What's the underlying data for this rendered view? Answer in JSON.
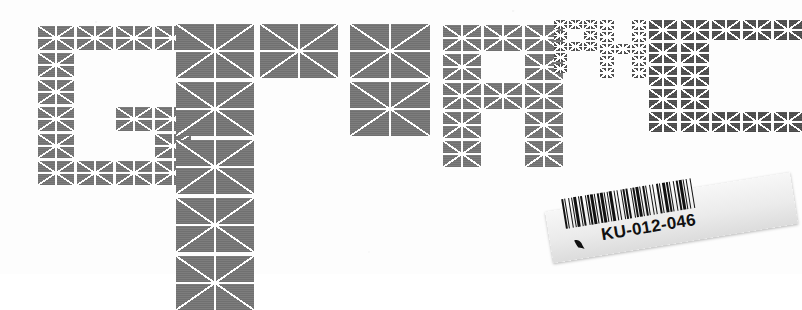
{
  "poster": {
    "word": "GRAPHIC",
    "description": "Typographic poster: the word GRAPHIC built from grey image-placeholder modules (rectangles with an X and a centre cross) at varying scales on a white page",
    "background_color": "#ffffff",
    "module_color": "#767676",
    "module_color_dark": "#4e4e4e",
    "module_line_color": "#ffffff",
    "letters": [
      {
        "char": "G",
        "name": "letter-g",
        "x": 38,
        "y": 26,
        "cell_w": 36,
        "cell_h": 24,
        "gap": 3,
        "tone": "",
        "cols": 4,
        "rows": 6,
        "grid": [
          [
            1,
            1,
            1,
            1
          ],
          [
            1,
            0,
            0,
            0
          ],
          [
            1,
            0,
            0,
            0
          ],
          [
            1,
            0,
            1,
            1
          ],
          [
            1,
            0,
            0,
            1
          ],
          [
            1,
            1,
            1,
            1
          ]
        ]
      },
      {
        "char": "R",
        "name": "letter-r-large",
        "x": 176,
        "y": 24,
        "cell_w": 78,
        "cell_h": 54,
        "gap": 4,
        "tone": "",
        "cols": 1,
        "rows": 5,
        "grid": [
          [
            1
          ],
          [
            1
          ],
          [
            1
          ],
          [
            1
          ],
          [
            1
          ]
        ]
      },
      {
        "char": "A",
        "name": "letter-a-large",
        "x": 260,
        "y": 24,
        "cell_w": 78,
        "cell_h": 54,
        "gap": 4,
        "tone": "",
        "cols": 1,
        "rows": 1,
        "grid": [
          [
            1
          ]
        ]
      },
      {
        "char": "P",
        "name": "letter-p-large",
        "x": 350,
        "y": 24,
        "cell_w": 80,
        "cell_h": 54,
        "gap": 4,
        "tone": "",
        "cols": 1,
        "rows": 2,
        "grid": [
          [
            1
          ],
          [
            1
          ]
        ]
      },
      {
        "char": "R",
        "name": "letter-r-medium",
        "x": 443,
        "y": 25,
        "cell_w": 38,
        "cell_h": 26,
        "gap": 3,
        "tone": "",
        "cols": 3,
        "rows": 5,
        "grid": [
          [
            1,
            1,
            1
          ],
          [
            1,
            0,
            1
          ],
          [
            1,
            1,
            1
          ],
          [
            1,
            0,
            1
          ],
          [
            1,
            0,
            1
          ]
        ]
      },
      {
        "char": "P",
        "name": "letter-p-tiny",
        "x": 554,
        "y": 20,
        "cell_w": 13,
        "cell_h": 9,
        "gap": 2,
        "tone": "dark",
        "cols": 3,
        "rows": 5,
        "grid": [
          [
            1,
            1,
            1
          ],
          [
            1,
            0,
            1
          ],
          [
            1,
            1,
            1
          ],
          [
            1,
            0,
            0
          ],
          [
            1,
            0,
            0
          ]
        ]
      },
      {
        "char": "H",
        "name": "letter-h-tiny",
        "x": 600,
        "y": 20,
        "cell_w": 14,
        "cell_h": 10,
        "gap": 2,
        "tone": "dark",
        "cols": 3,
        "rows": 5,
        "grid": [
          [
            1,
            0,
            1
          ],
          [
            1,
            0,
            1
          ],
          [
            1,
            1,
            1
          ],
          [
            1,
            0,
            1
          ],
          [
            1,
            0,
            1
          ]
        ]
      },
      {
        "char": "I",
        "name": "letter-i-small",
        "x": 649,
        "y": 20,
        "cell_w": 28,
        "cell_h": 20,
        "gap": 3,
        "tone": "dark",
        "cols": 1,
        "rows": 5,
        "grid": [
          [
            1
          ],
          [
            1
          ],
          [
            1
          ],
          [
            1
          ],
          [
            1
          ]
        ]
      },
      {
        "char": "C",
        "name": "letter-c-small",
        "x": 681,
        "y": 20,
        "cell_w": 28,
        "cell_h": 20,
        "gap": 3,
        "tone": "dark",
        "cols": 4,
        "rows": 5,
        "grid": [
          [
            1,
            1,
            1,
            1
          ],
          [
            1,
            0,
            0,
            0
          ],
          [
            1,
            0,
            0,
            0
          ],
          [
            1,
            0,
            0,
            0
          ],
          [
            1,
            1,
            1,
            1
          ]
        ]
      }
    ]
  },
  "barcode_label": {
    "name": "barcode-label",
    "code_text": "KU-012-046",
    "check_icon": "checkmark-icon",
    "rotation_deg": -9.2,
    "bar_pattern": [
      2,
      1,
      1,
      3,
      1,
      2,
      1,
      1,
      3,
      2,
      1,
      1,
      2,
      3,
      1,
      1,
      2,
      1,
      3,
      1,
      1,
      2,
      2,
      1,
      3,
      1,
      1,
      2,
      1,
      1,
      3,
      2,
      1,
      2,
      1,
      3,
      1,
      1,
      2,
      1,
      2,
      3,
      1,
      1,
      2,
      1,
      3,
      1,
      1,
      2,
      2,
      1,
      1,
      3,
      1,
      2,
      1,
      3,
      2,
      1,
      1,
      2,
      3,
      1,
      2,
      1,
      1,
      3,
      1,
      2,
      2,
      1,
      3,
      1,
      1,
      2,
      1,
      3,
      1,
      2
    ],
    "paper_color": "#efefef",
    "bar_color": "#111111"
  }
}
